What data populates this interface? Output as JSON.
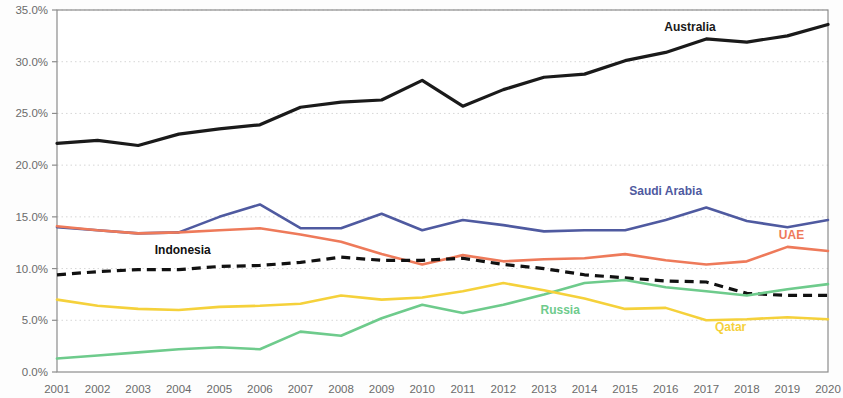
{
  "chart_data": {
    "type": "line",
    "title": "",
    "subtitle": "",
    "xlabel": "",
    "ylabel": "",
    "xlim": [
      2001,
      2020
    ],
    "ylim": [
      0,
      35
    ],
    "grid": true,
    "grid_axis": "y",
    "legend_position": "inline-labels",
    "x": [
      2001,
      2002,
      2003,
      2004,
      2005,
      2006,
      2007,
      2008,
      2009,
      2010,
      2011,
      2012,
      2013,
      2014,
      2015,
      2016,
      2017,
      2018,
      2019,
      2020
    ],
    "xtick_labels": [
      "2001",
      "2002",
      "2003",
      "2004",
      "2005",
      "2006",
      "2007",
      "2008",
      "2009",
      "2010",
      "2011",
      "2012",
      "2013",
      "2014",
      "2015",
      "2016",
      "2017",
      "2018",
      "2019",
      "2020"
    ],
    "ytick_values": [
      0,
      5,
      10,
      15,
      20,
      25,
      30,
      35
    ],
    "ytick_labels": [
      "0.0%",
      "5.0%",
      "10.0%",
      "15.0%",
      "20.0%",
      "25.0%",
      "30.0%",
      "35.0%"
    ],
    "series": [
      {
        "name": "Australia",
        "color": "#1a1a1a",
        "style": "solid",
        "width": 3.2,
        "label_x": 2016.6,
        "label_y": 33.0,
        "label_anchor": "middle",
        "values": [
          22.1,
          22.4,
          21.9,
          23.0,
          23.5,
          23.9,
          25.6,
          26.1,
          26.3,
          28.2,
          25.7,
          27.3,
          28.5,
          28.8,
          30.1,
          30.9,
          32.2,
          31.9,
          32.5,
          33.6
        ]
      },
      {
        "name": "Saudi Arabia",
        "color": "#4f5aa0",
        "style": "solid",
        "width": 2.6,
        "label_x": 2016.0,
        "label_y": 17.1,
        "label_anchor": "middle",
        "values": [
          14.0,
          13.7,
          13.4,
          13.5,
          15.0,
          16.2,
          13.9,
          13.9,
          15.3,
          13.7,
          14.7,
          14.2,
          13.6,
          13.7,
          13.7,
          14.7,
          15.9,
          14.6,
          14.0,
          14.7
        ]
      },
      {
        "name": "UAE",
        "color": "#ee7a5a",
        "style": "solid",
        "width": 2.6,
        "label_x": 2019.1,
        "label_y": 12.9,
        "label_anchor": "middle",
        "values": [
          14.1,
          13.7,
          13.4,
          13.5,
          13.7,
          13.9,
          13.3,
          12.6,
          11.4,
          10.4,
          11.3,
          10.7,
          10.9,
          11.0,
          11.4,
          10.8,
          10.4,
          10.7,
          12.1,
          11.7
        ]
      },
      {
        "name": "Indonesia",
        "color": "#111111",
        "style": "dashed",
        "width": 3.2,
        "label_x": 2004.1,
        "label_y": 11.4,
        "label_anchor": "middle",
        "values": [
          9.4,
          9.7,
          9.9,
          9.9,
          10.2,
          10.3,
          10.6,
          11.1,
          10.8,
          10.8,
          11.0,
          10.4,
          10.0,
          9.4,
          9.1,
          8.8,
          8.7,
          7.6,
          7.4,
          7.4
        ]
      },
      {
        "name": "Russia",
        "color": "#6ecb8c",
        "style": "solid",
        "width": 2.6,
        "label_x": 2013.4,
        "label_y": 5.6,
        "label_anchor": "middle",
        "values": [
          1.3,
          1.6,
          1.9,
          2.2,
          2.4,
          2.2,
          3.9,
          3.5,
          5.2,
          6.5,
          5.7,
          6.5,
          7.5,
          8.6,
          8.9,
          8.2,
          7.8,
          7.4,
          8.0,
          8.5
        ]
      },
      {
        "name": "Qatar",
        "color": "#f5d13b",
        "style": "solid",
        "width": 2.6,
        "label_x": 2017.6,
        "label_y": 4.0,
        "label_anchor": "middle",
        "values": [
          7.0,
          6.4,
          6.1,
          6.0,
          6.3,
          6.4,
          6.6,
          7.4,
          7.0,
          7.2,
          7.8,
          8.6,
          7.9,
          7.1,
          6.1,
          6.2,
          5.0,
          5.1,
          5.3,
          5.1
        ]
      }
    ]
  },
  "axis": {
    "y_axis_name": "percent-axis",
    "x_axis_name": "year-axis"
  }
}
